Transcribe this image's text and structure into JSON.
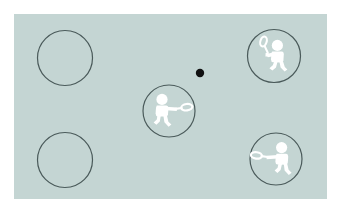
{
  "scene": {
    "title": "Badminton court position diagram",
    "canvas": {
      "width": 340,
      "height": 214
    },
    "outer_background_color": "#ffffff",
    "court": {
      "label": "court-panel",
      "x": 14,
      "y": 14,
      "width": 313,
      "height": 185,
      "fill_color": "#c4d5d3"
    },
    "circle_outline_color": "#4a5a5a",
    "circle_outline_width": 1.2,
    "player_fill_color": "#ffffff",
    "player_outline_color": "#5a6a6a",
    "shuttle": {
      "label": "shuttlecock",
      "cx": 200,
      "cy": 73,
      "r": 4.2,
      "color": "#111111"
    },
    "positions": [
      {
        "id": "top-left",
        "label": "Empty position, back left",
        "occupied": false,
        "cx": 65,
        "cy": 58,
        "r": 27.5,
        "player": null
      },
      {
        "id": "top-right",
        "label": "Player, back right, overhead smash",
        "occupied": true,
        "cx": 274,
        "cy": 56,
        "r": 26.5,
        "player": {
          "pose": "overhead-raised-racket",
          "facing": "left",
          "racket_direction": "up-left"
        }
      },
      {
        "id": "center",
        "label": "Player, mid court, forehand drive",
        "occupied": true,
        "cx": 169,
        "cy": 111,
        "r": 26,
        "player": {
          "pose": "forward-extended-racket",
          "facing": "right",
          "racket_direction": "right"
        }
      },
      {
        "id": "bottom-left",
        "label": "Empty position, front left",
        "occupied": false,
        "cx": 65,
        "cy": 160,
        "r": 27.5,
        "player": null
      },
      {
        "id": "bottom-right",
        "label": "Player, front right, backhand reach",
        "occupied": true,
        "cx": 276,
        "cy": 159,
        "r": 26,
        "player": {
          "pose": "forward-extended-racket",
          "facing": "left",
          "racket_direction": "left"
        }
      }
    ]
  }
}
